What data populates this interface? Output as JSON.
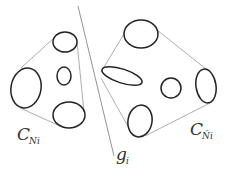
{
  "figure": {
    "left_group": {
      "label": "C",
      "label_sub": "Ni",
      "ellipses": [
        {
          "cx": 65,
          "cy": 42,
          "rx": 12,
          "ry": 10,
          "rot": 0
        },
        {
          "cx": 64,
          "cy": 76,
          "rx": 7,
          "ry": 9,
          "rot": 0
        },
        {
          "cx": 26,
          "cy": 88,
          "rx": 15,
          "ry": 20,
          "rot": 10
        },
        {
          "cx": 69,
          "cy": 115,
          "rx": 16,
          "ry": 13,
          "rot": 0
        }
      ]
    },
    "right_group": {
      "label": "C",
      "label_sub": "Ñi",
      "ellipses": [
        {
          "cx": 141,
          "cy": 34,
          "rx": 17,
          "ry": 14,
          "rot": 0
        },
        {
          "cx": 122,
          "cy": 76,
          "rx": 21,
          "ry": 7,
          "rot": 18
        },
        {
          "cx": 171,
          "cy": 88,
          "rx": 10,
          "ry": 10,
          "rot": 0
        },
        {
          "cx": 206,
          "cy": 86,
          "rx": 10,
          "ry": 17,
          "rot": -8
        },
        {
          "cx": 140,
          "cy": 121,
          "rx": 12,
          "ry": 16,
          "rot": 10
        }
      ]
    },
    "separator": {
      "label": "g",
      "label_sub": "i"
    },
    "colors": {
      "ellipse_stroke": "#222222",
      "hull_stroke": "#999999",
      "line_stroke": "#777777"
    }
  }
}
